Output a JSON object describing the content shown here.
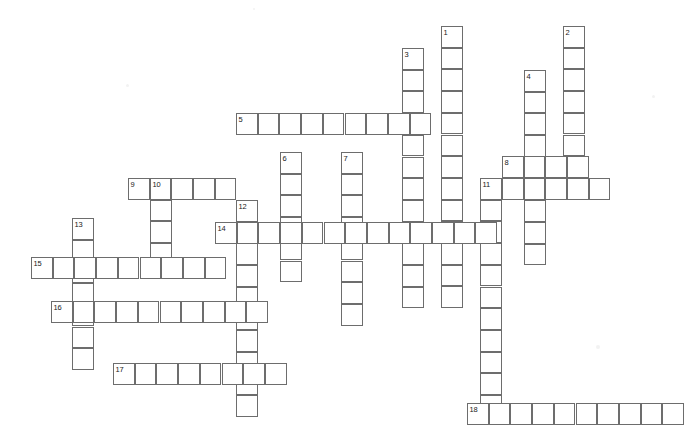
{
  "puzzle": {
    "title": "Crossword Puzzle Grid",
    "cell_size": 21.7,
    "background_color": "#ffffff",
    "cell_border_color": "#6d6d6d",
    "number_color": "#1a1a1a",
    "width": 699,
    "height": 446,
    "entry_count": 18,
    "entries": [
      {
        "number": "1",
        "direction": "down",
        "x": 441,
        "y": 26,
        "length": 13
      },
      {
        "number": "2",
        "direction": "down",
        "x": 563,
        "y": 26,
        "length": 8
      },
      {
        "number": "3",
        "direction": "down",
        "x": 402,
        "y": 48,
        "length": 12
      },
      {
        "number": "4",
        "direction": "down",
        "x": 524,
        "y": 70,
        "length": 9
      },
      {
        "number": "5",
        "direction": "across",
        "x": 236,
        "y": 113,
        "length": 9
      },
      {
        "number": "6",
        "direction": "down",
        "x": 280,
        "y": 152,
        "length": 6
      },
      {
        "number": "7",
        "direction": "down",
        "x": 341,
        "y": 152,
        "length": 8
      },
      {
        "number": "8",
        "direction": "across",
        "x": 502,
        "y": 156,
        "length": 4
      },
      {
        "number": "9",
        "direction": "across",
        "x": 128,
        "y": 178,
        "length": 5
      },
      {
        "number": "10",
        "direction": "down",
        "x": 150,
        "y": 178,
        "length": 4
      },
      {
        "number": "11",
        "direction": "down",
        "x": 480,
        "y": 178,
        "length": 11
      },
      {
        "number": "12",
        "direction": "down",
        "x": 236,
        "y": 200,
        "length": 10
      },
      {
        "number": "13",
        "direction": "down",
        "x": 72,
        "y": 218,
        "length": 7
      },
      {
        "number": "14",
        "direction": "across",
        "x": 215,
        "y": 222,
        "length": 13
      },
      {
        "number": "15",
        "direction": "across",
        "x": 31,
        "y": 257,
        "length": 9
      },
      {
        "number": "16",
        "direction": "across",
        "x": 51,
        "y": 301,
        "length": 10
      },
      {
        "number": "17",
        "direction": "across",
        "x": 113,
        "y": 363,
        "length": 8
      },
      {
        "number": "18",
        "direction": "across",
        "x": 467,
        "y": 403,
        "length": 10
      }
    ],
    "extra_across_runs": [
      {
        "x": 502,
        "y": 178,
        "length": 5
      }
    ],
    "specks": [
      {
        "x": 126,
        "y": 84,
        "size": 3
      },
      {
        "x": 652,
        "y": 95,
        "size": 3
      },
      {
        "x": 596,
        "y": 345,
        "size": 4
      },
      {
        "x": 253,
        "y": 8,
        "size": 2
      }
    ]
  }
}
